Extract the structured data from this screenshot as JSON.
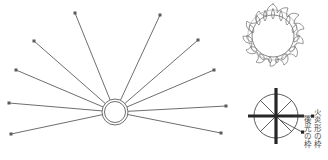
{
  "figure": {
    "title": "",
    "background_color": "#ffffff",
    "stroke_color": "#666666",
    "text_color": "#4a4a4a"
  },
  "rays_diagram": {
    "name": "radiating-rays-diagram",
    "center": {
      "x": 115,
      "y": 112,
      "outer_radius": 13,
      "inner_radius": 10.5
    },
    "ray_count": 10,
    "rays": [
      {
        "id": "ray-1",
        "end_x": 11,
        "end_y": 134
      },
      {
        "id": "ray-2",
        "end_x": 9,
        "end_y": 103
      },
      {
        "id": "ray-3",
        "end_x": 16,
        "end_y": 70
      },
      {
        "id": "ray-4",
        "end_x": 34,
        "end_y": 41
      },
      {
        "id": "ray-5",
        "end_x": 75,
        "end_y": 13
      },
      {
        "id": "ray-6",
        "end_x": 160,
        "end_y": 15
      },
      {
        "id": "ray-7",
        "end_x": 198,
        "end_y": 40
      },
      {
        "id": "ray-8",
        "end_x": 214,
        "end_y": 70
      },
      {
        "id": "ray-9",
        "end_x": 226,
        "end_y": 106
      },
      {
        "id": "ray-10",
        "end_x": 221,
        "end_y": 133
      }
    ]
  },
  "flame_frame": {
    "name": "flame-shaped-frame-illustration",
    "caption": "",
    "center": {
      "x": 39,
      "y": 36,
      "radius": 21
    }
  },
  "halo_frame": {
    "name": "halo-frame-diagram",
    "center": {
      "x": 42,
      "y": 42,
      "radius": 22
    },
    "spoke_count": 8
  },
  "labels": {
    "flame_frame_label": "火炎形の枠",
    "halo_frame_label": "後光の枠"
  }
}
